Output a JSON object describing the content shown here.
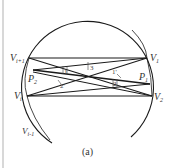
{
  "figure": {
    "caption": "(a)",
    "colors": {
      "line": "#1a1a1a",
      "label": "#333333",
      "page_rule": "#d8d8d8"
    },
    "vertices": [
      {
        "id": "Vi+1",
        "base": "V",
        "sub": "i+1",
        "x": 29,
        "y": 58
      },
      {
        "id": "V1",
        "base": "V",
        "sub": "1",
        "x": 147,
        "y": 58
      },
      {
        "id": "Vi",
        "base": "V",
        "sub": "i",
        "x": 27,
        "y": 96
      },
      {
        "id": "V2",
        "base": "V",
        "sub": "2",
        "x": 152,
        "y": 96
      },
      {
        "id": "Vi-1",
        "base": "V",
        "sub": "i-1",
        "x": 40,
        "y": 130
      }
    ],
    "points": [
      {
        "id": "P1",
        "base": "P",
        "sub": "1",
        "x": 143,
        "y": 83
      },
      {
        "id": "P2",
        "base": "P",
        "sub": "2",
        "x": 37,
        "y": 69
      }
    ],
    "angle_labels": [
      {
        "text": "1",
        "x": 64,
        "y": 72
      },
      {
        "text": "2'",
        "x": 61,
        "y": 85
      },
      {
        "text": "3",
        "x": 93,
        "y": 68
      },
      {
        "text": "1'",
        "x": 116,
        "y": 72
      },
      {
        "text": "2",
        "x": 114,
        "y": 84
      }
    ],
    "label_text": {
      "vi1_base": "V",
      "vi1_sub": "i+1",
      "v1_base": "V",
      "v1_sub": "1",
      "p2_base": "P",
      "p2_sub": "2",
      "p1_base": "P",
      "p1_sub": "1",
      "vi_base": "V",
      "vi_sub": "i",
      "v2_base": "V",
      "v2_sub": "2",
      "vim1_base": "V",
      "vim1_sub": "i-1",
      "a1": "1",
      "a2p": "2'",
      "a3": "3",
      "a1p": "1'",
      "a2": "2"
    }
  }
}
